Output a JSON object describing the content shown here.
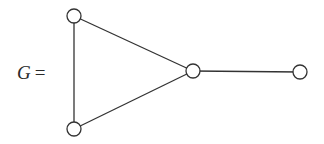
{
  "diagram": {
    "label_var": "G",
    "label_eq": "=",
    "nodes": [
      {
        "id": "v1",
        "x": 74,
        "y": 16
      },
      {
        "id": "v2",
        "x": 74,
        "y": 129
      },
      {
        "id": "v3",
        "x": 193,
        "y": 71
      },
      {
        "id": "v4",
        "x": 300,
        "y": 72
      }
    ],
    "edges": [
      [
        "v1",
        "v2"
      ],
      [
        "v1",
        "v3"
      ],
      [
        "v2",
        "v3"
      ],
      [
        "v3",
        "v4"
      ]
    ],
    "node_radius": 7,
    "colors": {
      "stroke": "#333333",
      "fill": "#ffffff",
      "text": "#2a2a2a"
    }
  }
}
